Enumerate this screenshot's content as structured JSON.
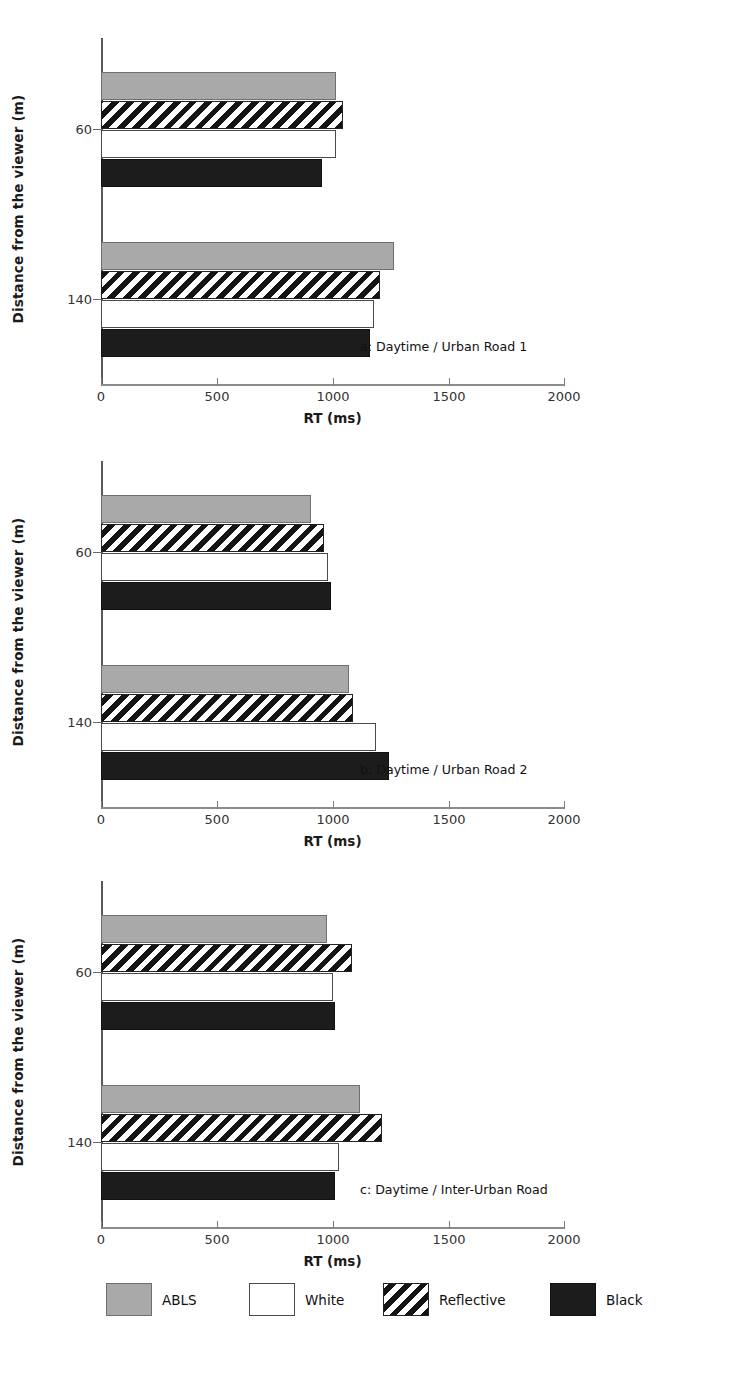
{
  "chart_data": [
    {
      "type": "bar",
      "orientation": "horizontal",
      "title": "a: Daytime / Urban Road 1",
      "xlabel": "RT (ms)",
      "ylabel": "Distance from the viewer (m)",
      "categories": [
        "60",
        "140"
      ],
      "xticks": [
        0,
        500,
        1000,
        1500,
        2000
      ],
      "xticklabels": [
        "0",
        "500",
        "1000",
        "1500",
        "2000"
      ],
      "xlim": [
        0,
        2000
      ],
      "grid": false,
      "legend_position": "bottom",
      "series": [
        {
          "name": "ABLS",
          "values": [
            1015,
            1265
          ]
        },
        {
          "name": "Reflective",
          "values": [
            1045,
            1205
          ]
        },
        {
          "name": "White",
          "values": [
            1015,
            1180
          ]
        },
        {
          "name": "Black",
          "values": [
            955,
            1160
          ]
        }
      ]
    },
    {
      "type": "bar",
      "orientation": "horizontal",
      "title": "b: Daytime / Urban Road 2",
      "xlabel": "RT (ms)",
      "ylabel": "Distance from the viewer (m)",
      "categories": [
        "60",
        "140"
      ],
      "xticks": [
        0,
        500,
        1000,
        1500,
        2000
      ],
      "xticklabels": [
        "0",
        "500",
        "1000",
        "1500",
        "2000"
      ],
      "xlim": [
        0,
        2000
      ],
      "grid": false,
      "legend_position": "bottom",
      "series": [
        {
          "name": "ABLS",
          "values": [
            905,
            1070
          ]
        },
        {
          "name": "Reflective",
          "values": [
            965,
            1090
          ]
        },
        {
          "name": "White",
          "values": [
            980,
            1190
          ]
        },
        {
          "name": "Black",
          "values": [
            995,
            1245
          ]
        }
      ]
    },
    {
      "type": "bar",
      "orientation": "horizontal",
      "title": "c: Daytime / Inter-Urban Road",
      "xlabel": "RT (ms)",
      "ylabel": "Distance from the viewer (m)",
      "categories": [
        "60",
        "140"
      ],
      "xticks": [
        0,
        500,
        1000,
        1500,
        2000
      ],
      "xticklabels": [
        "0",
        "500",
        "1000",
        "1500",
        "2000"
      ],
      "xlim": [
        0,
        2000
      ],
      "grid": false,
      "legend_position": "bottom",
      "series": [
        {
          "name": "ABLS",
          "values": [
            975,
            1120
          ]
        },
        {
          "name": "Reflective",
          "values": [
            1085,
            1215
          ]
        },
        {
          "name": "White",
          "values": [
            1000,
            1030
          ]
        },
        {
          "name": "Black",
          "values": [
            1010,
            1010
          ]
        }
      ]
    }
  ],
  "panels": [
    {
      "caption": "a: Daytime / Urban Road 1",
      "xlabel": "RT (ms)",
      "ylabel": "Distance from the viewer (m)",
      "ytick_labels": [
        "60",
        "140"
      ],
      "xtick_labels": [
        "0",
        "500",
        "1000",
        "1500",
        "2000"
      ]
    },
    {
      "caption": "b: Daytime / Urban Road 2",
      "xlabel": "RT (ms)",
      "ylabel": "Distance from the viewer (m)",
      "ytick_labels": [
        "60",
        "140"
      ],
      "xtick_labels": [
        "0",
        "500",
        "1000",
        "1500",
        "2000"
      ]
    },
    {
      "caption": "c: Daytime / Inter-Urban Road",
      "xlabel": "RT (ms)",
      "ylabel": "Distance from the viewer (m)",
      "ytick_labels": [
        "60",
        "140"
      ],
      "xtick_labels": [
        "0",
        "500",
        "1000",
        "1500",
        "2000"
      ]
    }
  ],
  "legend": {
    "items": [
      {
        "label": "ABLS",
        "swatch": "abls",
        "color": "#a9a9a9"
      },
      {
        "label": "White",
        "swatch": "white",
        "color": "#ffffff"
      },
      {
        "label": "Reflective",
        "swatch": "reflective",
        "color": "#141414"
      },
      {
        "label": "Black",
        "swatch": "black",
        "color": "#1c1c1c"
      }
    ]
  }
}
